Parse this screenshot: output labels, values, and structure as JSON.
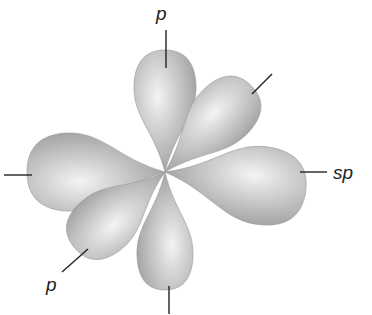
{
  "diagram": {
    "type": "orbital-hybridization",
    "center": {
      "x": 165,
      "y": 172
    },
    "colors": {
      "lobe_light": "#f2f2f2",
      "lobe_mid": "#c4c4c4",
      "lobe_dark": "#8c8c8c",
      "leader_line": "#222222",
      "background": "#ffffff"
    },
    "lobes": [
      {
        "name": "lobe-sp-left",
        "angle": 180,
        "length": 138,
        "width": 78
      },
      {
        "name": "lobe-p-bottom",
        "angle": 90,
        "length": 118,
        "width": 56
      },
      {
        "name": "lobe-p-lower-left",
        "angle": 140,
        "length": 118,
        "width": 62
      },
      {
        "name": "lobe-p-top",
        "angle": -90,
        "length": 122,
        "width": 62
      },
      {
        "name": "lobe-p-upper-right",
        "angle": -45,
        "length": 122,
        "width": 62
      },
      {
        "name": "lobe-sp-right",
        "angle": 8,
        "length": 142,
        "width": 78
      }
    ],
    "labels": [
      {
        "id": "label-p-top",
        "text": "p",
        "x": 156,
        "y": 4
      },
      {
        "id": "label-sp-right",
        "text": "sp",
        "x": 333,
        "y": 163
      },
      {
        "id": "label-p-bottom-left",
        "text": "p",
        "x": 46,
        "y": 275
      }
    ],
    "leader_lines": [
      {
        "name": "leader-p-top",
        "x1": 166,
        "y1": 30,
        "x2": 166,
        "y2": 68
      },
      {
        "name": "leader-sp-right",
        "x1": 300,
        "y1": 172,
        "x2": 327,
        "y2": 172
      },
      {
        "name": "leader-p-bottom-left",
        "x1": 62,
        "y1": 272,
        "x2": 88,
        "y2": 249
      },
      {
        "name": "leader-upper-right",
        "x1": 252,
        "y1": 94,
        "x2": 272,
        "y2": 74
      },
      {
        "name": "leader-left",
        "x1": 4,
        "y1": 175,
        "x2": 32,
        "y2": 175
      },
      {
        "name": "leader-bottom",
        "x1": 169,
        "y1": 286,
        "x2": 169,
        "y2": 314
      }
    ]
  }
}
